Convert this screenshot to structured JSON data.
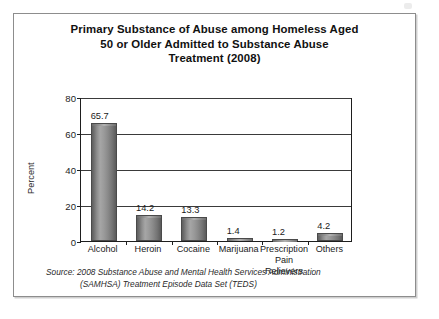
{
  "card": {
    "title_lines": [
      "Primary Substance of Abuse among Homeless Aged",
      "50 or Older Admitted to Substance Abuse",
      "Treatment (2008)"
    ]
  },
  "source": {
    "line1": "Source: 2008 Substance Abuse and Mental Health Services Administration",
    "line2": "(SAMHSA) Treatment Episode Data Set (TEDS)"
  },
  "chart_data": {
    "type": "bar",
    "title": "Primary Substance of Abuse among Homeless Aged 50 or Older Admitted to Substance Abuse Treatment (2008)",
    "xlabel": "",
    "ylabel": "Percent",
    "ylim": [
      0,
      80
    ],
    "yticks": [
      0,
      20,
      40,
      60,
      80
    ],
    "ytick_labels": [
      "0",
      "20",
      "40",
      "60",
      "80"
    ],
    "grid": true,
    "legend": false,
    "categories": [
      "Alcohol",
      "Heroin",
      "Cocaine",
      "Marijuana",
      "Prescription Pain Relievers",
      "Others"
    ],
    "category_label_lines": [
      [
        "Alcohol"
      ],
      [
        "Heroin"
      ],
      [
        "Cocaine"
      ],
      [
        "Marijuana"
      ],
      [
        "Prescription",
        "Pain Relievers"
      ],
      [
        "Others"
      ]
    ],
    "values": [
      65.7,
      14.2,
      13.3,
      1.4,
      1.2,
      4.2
    ],
    "value_labels": [
      "65.7",
      "14.2",
      "13.3",
      "1.4",
      "1.2",
      "4.2"
    ],
    "bar_color": "#8c8c8c",
    "bar_edge_color": "#4a4a4a"
  }
}
